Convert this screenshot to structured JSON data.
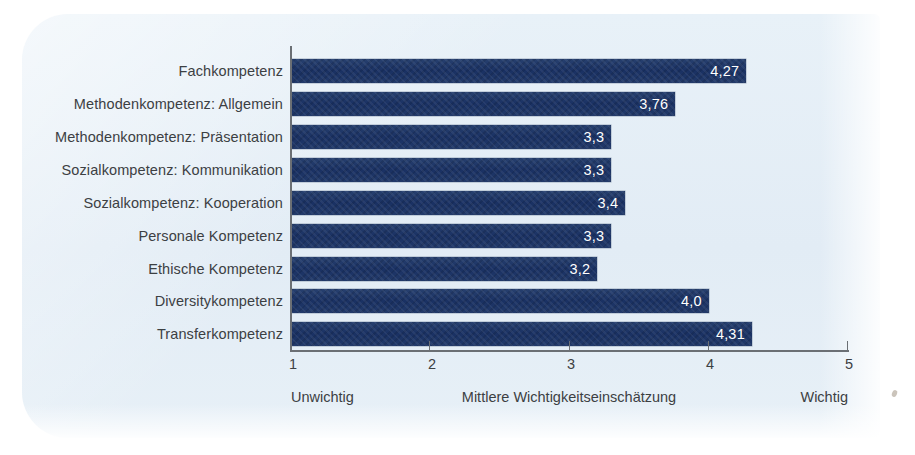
{
  "chart_data": {
    "type": "bar",
    "orientation": "horizontal",
    "title": "",
    "xlabel": "Mittlere Wichtigkeitseinschätzung",
    "ylabel": "",
    "xlim": [
      1,
      5
    ],
    "xticks": [
      "1",
      "2",
      "3",
      "4",
      "5"
    ],
    "grid": false,
    "legend": "none",
    "decimal_separator": ",",
    "categories": [
      "Fachkompetenz",
      "Methodenkompetenz: Allgemein",
      "Methodenkompetenz: Präsentation",
      "Sozialkompetenz: Kommunikation",
      "Sozialkompetenz: Kooperation",
      "Personale Kompetenz",
      "Ethische Kompetenz",
      "Diversitykompetenz",
      "Transferkompetenz"
    ],
    "values": [
      4.27,
      3.76,
      3.3,
      3.3,
      3.4,
      3.3,
      3.2,
      4.0,
      4.31
    ],
    "value_labels": [
      "4,27",
      "3,76",
      "3,3",
      "3,3",
      "3,4",
      "3,3",
      "3,2",
      "4,0",
      "4,31"
    ],
    "axis_captions": {
      "left": "Unwichtig",
      "center": "Mittlere Wichtigkeitseinschätzung",
      "right": "Wichtig"
    },
    "colors": {
      "bar": "#1d3a6e",
      "bar_value_text": "#ffffff",
      "panel_background": "#e6eff7",
      "axis": "#6b6f74",
      "label_text": "#3c4043",
      "page_background": "#ffffff"
    }
  }
}
